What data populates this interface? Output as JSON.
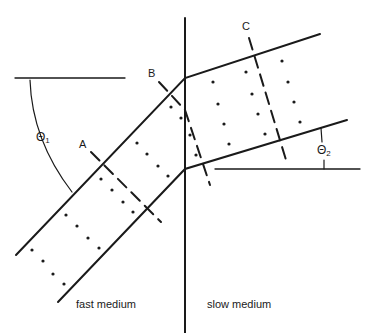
{
  "diagram": {
    "labels": {
      "A": "A",
      "B": "B",
      "C": "C",
      "theta1": "Θ",
      "theta1_sub": "1",
      "theta2": "Θ",
      "theta2_sub": "2",
      "fast_medium": "fast medium",
      "slow_medium": "slow medium"
    },
    "colors": {
      "ink": "#1a1a1a",
      "background": "#ffffff"
    },
    "elements": {
      "interface_line": "vertical boundary between media",
      "ray_upper": "upper beam boundary (bends at interface)",
      "ray_lower": "lower beam boundary (bends at interface)",
      "wavefront_A": "dashed wavefront in fast medium",
      "wavefront_B": "dashed wavefront straddling interface",
      "wavefront_C": "dashed wavefront in slow medium",
      "angle_theta1": "incidence angle reference",
      "angle_theta2": "refraction angle reference"
    }
  }
}
